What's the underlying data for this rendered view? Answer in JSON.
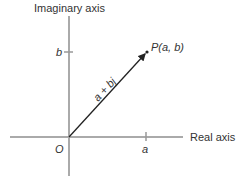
{
  "diagram": {
    "type": "complex-plane",
    "axes": {
      "vertical_label": "Imaginary axis",
      "horizontal_label": "Real axis",
      "origin_label": "O"
    },
    "ticks": {
      "imaginary_tick_label": "b",
      "real_tick_label": "a"
    },
    "point": {
      "label": "P(a, b)"
    },
    "vector": {
      "label": "a + bj"
    },
    "colors": {
      "axis": "#aaaaaa",
      "vector": "#222222",
      "text": "#333333"
    }
  }
}
